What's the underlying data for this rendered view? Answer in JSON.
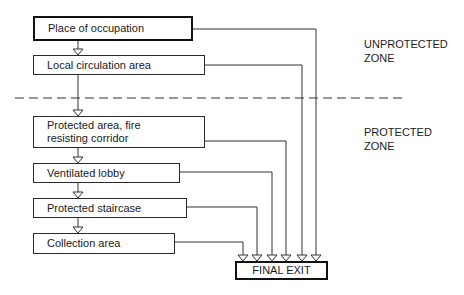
{
  "diagram": {
    "zones": {
      "unprotected": "UNPROTECTED\nZONE",
      "unprotected_line1": "UNPROTECTED",
      "unprotected_line2": "ZONE",
      "protected_line1": "PROTECTED",
      "protected_line2": "ZONE"
    },
    "boxes": [
      {
        "label": "Place of occupation"
      },
      {
        "label": "Local circulation area"
      },
      {
        "label_line1": "Protected area, fire",
        "label_line2": "resisting corridor"
      },
      {
        "label": "Ventilated lobby"
      },
      {
        "label": "Protected staircase"
      },
      {
        "label": "Collection area"
      }
    ],
    "final_exit": "FINAL EXIT",
    "colors": {
      "line": "#2a2a2a",
      "background": "#ffffff"
    }
  }
}
